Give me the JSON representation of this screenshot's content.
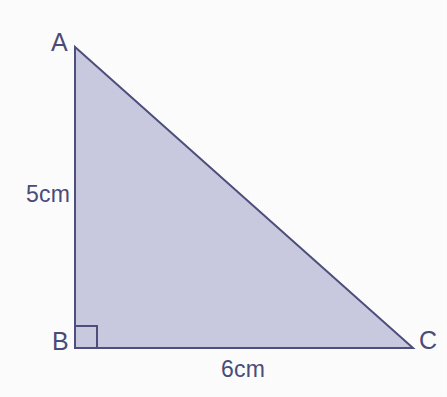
{
  "figure": {
    "background_color": "#fdfdfd",
    "fill_color": "#c9cae1",
    "stroke_color": "#4f4f7d",
    "text_color": "#4b4b78",
    "stroke_width": 2
  },
  "vertices": [
    {
      "id": "A",
      "label": "A",
      "x": 75,
      "y": 47
    },
    {
      "id": "B",
      "label": "B",
      "x": 75,
      "y": 348
    },
    {
      "id": "C",
      "label": "C",
      "x": 413,
      "y": 348
    }
  ],
  "sides": [
    {
      "id": "AB",
      "label": "5cm",
      "value": 5,
      "unit": "cm",
      "from": "A",
      "to": "B"
    },
    {
      "id": "BC",
      "label": "6cm",
      "value": 6,
      "unit": "cm",
      "from": "B",
      "to": "C"
    },
    {
      "id": "AC",
      "label": "",
      "from": "A",
      "to": "C"
    }
  ],
  "markers": {
    "right_angle": {
      "name": "right-angle-marker",
      "at_vertex": "B",
      "size": 22
    }
  },
  "geometry": {
    "polygon_points": "75,47 75,348 413,348",
    "right_angle_path": "M 75 326 L 97 326 L 97 348"
  }
}
